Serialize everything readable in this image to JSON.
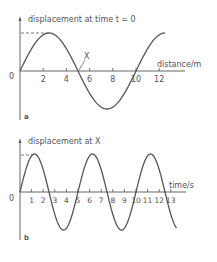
{
  "chart_data": [
    {
      "type": "line",
      "panel_label": "a",
      "title": "displacement at time t = 0",
      "ylabel": "displacement at time t = 0",
      "xlabel": "distance/m",
      "origin_label": "0",
      "x_ticks": [
        "2",
        "4",
        "6",
        "8",
        "10",
        "12"
      ],
      "x_tick_values": [
        2,
        4,
        6,
        8,
        10,
        12
      ],
      "xlim": [
        0,
        12.5
      ],
      "annotations": [
        {
          "text": "X",
          "x": 5,
          "y": 0
        }
      ],
      "series": [
        {
          "name": "displacement",
          "function": "sin",
          "amplitude": 1,
          "wavelength": 10,
          "x": [
            0,
            2.5,
            5,
            7.5,
            10,
            12.5
          ],
          "values": [
            0,
            1,
            0,
            -1,
            0,
            1
          ]
        }
      ],
      "grid": false,
      "dashed_amplitude_marker": true
    },
    {
      "type": "line",
      "panel_label": "b",
      "title": "displacement at X",
      "ylabel": "displacement at X",
      "xlabel": "time/s",
      "origin_label": "0",
      "x_ticks": [
        "1",
        "2",
        "3",
        "4",
        "5",
        "6",
        "7",
        "8",
        "9",
        "10",
        "11",
        "12",
        "13"
      ],
      "x_tick_values": [
        1,
        2,
        3,
        4,
        5,
        6,
        7,
        8,
        9,
        10,
        11,
        12,
        13
      ],
      "xlim": [
        0,
        13.5
      ],
      "series": [
        {
          "name": "displacement",
          "function": "sin",
          "amplitude": 1,
          "period": 5,
          "x": [
            0,
            1.25,
            2.5,
            3.75,
            5,
            6.25,
            7.5,
            8.75,
            10,
            11.25,
            12.5,
            13.5
          ],
          "values": [
            0,
            1,
            0,
            -1,
            0,
            1,
            0,
            -1,
            0,
            1,
            0,
            -0.95
          ]
        }
      ],
      "grid": false,
      "dashed_amplitude_marker": true
    }
  ]
}
